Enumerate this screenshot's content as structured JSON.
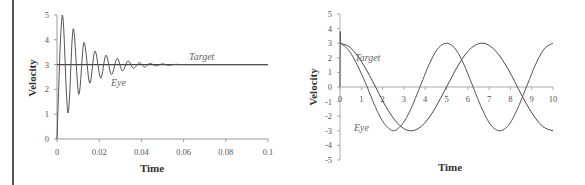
{
  "chart_data": [
    {
      "type": "line",
      "title": "",
      "xlabel": "Time",
      "ylabel": "Velocity",
      "xlim": [
        0,
        0.1
      ],
      "ylim": [
        0,
        5
      ],
      "grid": false,
      "xticks": [
        "0",
        "0.02",
        "0.04",
        "0.06",
        "0.08",
        "0.1"
      ],
      "yticks": [
        "0",
        "1",
        "2",
        "3",
        "4",
        "5"
      ],
      "annotations": [
        {
          "text": "Target",
          "x": 0.063,
          "y": 3.25
        },
        {
          "text": "Eye",
          "x": 0.026,
          "y": 2.25
        }
      ],
      "series": [
        {
          "name": "Target",
          "x": [
            0,
            0.1
          ],
          "values": [
            3,
            3
          ]
        },
        {
          "name": "Eye",
          "x": [
            0,
            0.0025,
            0.0052,
            0.0077,
            0.0103,
            0.0128,
            0.0155,
            0.018,
            0.0207,
            0.0232,
            0.0258,
            0.0285,
            0.031,
            0.0337,
            0.0362,
            0.039,
            0.0415,
            0.044,
            0.047,
            0.05,
            0.053,
            0.056,
            0.06,
            0.07,
            0.08,
            0.1
          ],
          "values": [
            0,
            5,
            1.05,
            4.45,
            1.8,
            3.9,
            2.25,
            3.55,
            2.45,
            3.38,
            2.6,
            3.25,
            2.75,
            3.15,
            2.85,
            3.08,
            2.9,
            3.05,
            2.95,
            3.03,
            2.97,
            3.01,
            3.0,
            3.0,
            3.0,
            3.0
          ]
        }
      ]
    },
    {
      "type": "line",
      "title": "",
      "xlabel": "Time",
      "ylabel": "Velocity",
      "xlim": [
        0,
        10
      ],
      "ylim": [
        -5,
        5
      ],
      "grid": false,
      "xticks": [
        "0",
        "1",
        "2",
        "3",
        "4",
        "5",
        "6",
        "7",
        "8",
        "9",
        "10"
      ],
      "yticks": [
        "5",
        "4",
        "3",
        "2",
        "1",
        "0",
        "-1",
        "-2",
        "-3",
        "-4",
        "-5"
      ],
      "annotations": [
        {
          "text": "Target",
          "x": 0.7,
          "y": 2.0
        },
        {
          "text": "Eye",
          "x": 0.7,
          "y": -2.8
        }
      ],
      "series": [
        {
          "name": "Target",
          "x": [
            0,
            0.42,
            0.83,
            1.25,
            1.67,
            2.08,
            2.5,
            2.92,
            3.33,
            3.75,
            4.17,
            4.58,
            5.0,
            5.42,
            5.83,
            6.25,
            6.67,
            7.08,
            7.5,
            7.92,
            8.33,
            8.75,
            9.17,
            9.58,
            10.0
          ],
          "values": [
            3,
            2.77,
            2.12,
            1.15,
            0,
            -1.15,
            -2.12,
            -2.77,
            -3,
            -2.77,
            -2.12,
            -1.15,
            0,
            1.15,
            2.12,
            2.77,
            3,
            2.77,
            2.12,
            1.15,
            0,
            -1.15,
            -2.12,
            -2.77,
            -3
          ]
        },
        {
          "name": "Eye",
          "x": [
            0,
            0.01,
            0.03,
            0.42,
            0.83,
            1.25,
            1.67,
            2.08,
            2.5,
            2.92,
            3.33,
            3.75,
            4.17,
            4.58,
            5.0,
            5.42,
            5.83,
            6.25,
            6.67,
            7.08,
            7.5,
            7.92,
            8.33,
            8.75,
            9.17,
            9.58,
            10.0
          ],
          "values": [
            0,
            3.8,
            3,
            2.5,
            1.45,
            0.1,
            -1.4,
            -2.5,
            -3,
            -2.55,
            -1.5,
            0,
            1.5,
            2.6,
            3,
            2.6,
            1.5,
            0,
            -1.5,
            -2.6,
            -3,
            -2.6,
            -1.5,
            0,
            1.5,
            2.6,
            3
          ]
        }
      ]
    }
  ],
  "charts": [
    {
      "xlabel": "Time",
      "ylabel": "Velocity",
      "target_label": "Target",
      "eye_label": "Eye"
    },
    {
      "xlabel": "Time",
      "ylabel": "Velocity",
      "target_label": "Target",
      "eye_label": "Eye"
    }
  ]
}
